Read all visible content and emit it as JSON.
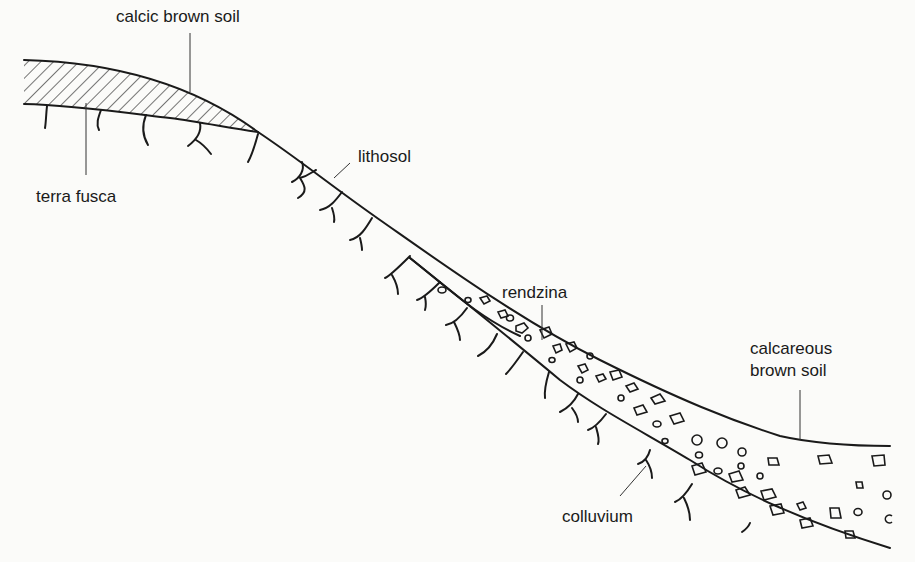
{
  "diagram": {
    "type": "soil catena cross-section",
    "labels": {
      "calcic_brown_soil": "calcic brown soil",
      "terra_fusca": "terra fusca",
      "lithosol": "lithosol",
      "rendzina": "rendzina",
      "calcareous_line1": "calcareous",
      "calcareous_line2": "brown soil",
      "colluvium": "colluvium"
    },
    "sequence_downslope": [
      "calcic brown soil",
      "terra fusca",
      "lithosol",
      "rendzina",
      "colluvium",
      "calcareous brown soil"
    ]
  }
}
